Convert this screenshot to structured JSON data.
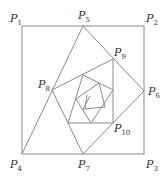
{
  "diagram": {
    "type": "nested-rotated-squares-spiral",
    "line_color": "#8a8a8a",
    "label_color": "#333333",
    "outer_square": {
      "x": 22,
      "y": 26,
      "width": 122,
      "height": 128
    },
    "labels": [
      {
        "id": "P1",
        "letter": "P",
        "sub": "1",
        "x": 10,
        "y": 22
      },
      {
        "id": "P2",
        "letter": "P",
        "sub": "2",
        "x": 146,
        "y": 22
      },
      {
        "id": "P3",
        "letter": "P",
        "sub": "3",
        "x": 146,
        "y": 168
      },
      {
        "id": "P4",
        "letter": "P",
        "sub": "4",
        "x": 10,
        "y": 168
      },
      {
        "id": "P5",
        "letter": "P",
        "sub": "5",
        "x": 78,
        "y": 19
      },
      {
        "id": "P6",
        "letter": "P",
        "sub": "6",
        "x": 148,
        "y": 95
      },
      {
        "id": "P7",
        "letter": "P",
        "sub": "7",
        "x": 78,
        "y": 168
      },
      {
        "id": "P8",
        "letter": "P",
        "sub": "8",
        "x": 38,
        "y": 88
      },
      {
        "id": "P9",
        "letter": "P",
        "sub": "9",
        "x": 114,
        "y": 56
      },
      {
        "id": "P10",
        "letter": "P",
        "sub": "10",
        "x": 114,
        "y": 132
      }
    ],
    "segments": [
      [
        22,
        154,
        83,
        26
      ],
      [
        83,
        26,
        144,
        91
      ],
      [
        144,
        91,
        83,
        154
      ],
      [
        83,
        154,
        52,
        90
      ],
      [
        52,
        90,
        113,
        59
      ],
      [
        113,
        59,
        113,
        123
      ],
      [
        113,
        123,
        68,
        123
      ],
      [
        83,
        75,
        113,
        90
      ],
      [
        83,
        75,
        68,
        123
      ],
      [
        113,
        90,
        91,
        123
      ],
      [
        99,
        83,
        76,
        99
      ],
      [
        99,
        83,
        105,
        107
      ],
      [
        105,
        107,
        83,
        109
      ],
      [
        76,
        99,
        91,
        123
      ],
      [
        87,
        95,
        85,
        108
      ],
      [
        83,
        109,
        90,
        96
      ]
    ]
  }
}
